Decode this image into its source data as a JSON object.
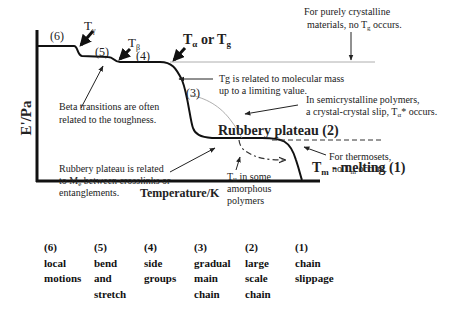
{
  "axes": {
    "y_label": "E'/Pa",
    "x_label": "Temperature/K"
  },
  "regions": [
    {
      "id": "6",
      "label": "(6)"
    },
    {
      "id": "5",
      "label": "(5)"
    },
    {
      "id": "4",
      "label": "(4)"
    },
    {
      "id": "3",
      "label": "(3)"
    }
  ],
  "transitions": {
    "gamma": {
      "base": "T",
      "sub": "γ"
    },
    "beta": {
      "base": "T",
      "sub": "β"
    },
    "alpha_g": {
      "base": "T",
      "sub1": "α",
      "mid": " or ",
      "base2": "T",
      "sub2": "g"
    },
    "melting": {
      "base": "T",
      "sub": "m",
      "rest": " - melting (1)"
    },
    "rubbery": "Rubbery plateau (2)"
  },
  "notes": {
    "crystalline": {
      "line1": "For purely crystalline",
      "line2_a": "materials,  no T",
      "line2_sub": "g",
      "line2_b": " occurs."
    },
    "tg_mass": {
      "line1": "Tg is related to molecular mass",
      "line2": "up to a limiting value."
    },
    "beta": {
      "line1": "Beta transitions are often",
      "line2": "related to the toughness."
    },
    "semicrystalline": {
      "line1": "In semicrystalline polymers,",
      "line2_a": "a crystal-crystal slip, T",
      "line2_sub": "α",
      "line2_b": "* occurs."
    },
    "rubbery": {
      "line1": "Rubbery plateau is related",
      "line2_a": "to M",
      "line2_sub": "e",
      "line2_b": " between crosslinks or",
      "line3": "entanglements."
    },
    "thermosets": {
      "line1": "For thermosets,",
      "line2_a": "no T",
      "line2_sub": "m",
      "line2_b": " occurs."
    },
    "tll": {
      "line1_a": "T",
      "line1_sub": "ll",
      "line1_b": "  in some",
      "line2": "amorphous",
      "line3": "polymers"
    }
  },
  "legend": [
    {
      "num": "(6)",
      "lines": [
        "local",
        "motions"
      ]
    },
    {
      "num": "(5)",
      "lines": [
        "bend",
        "and",
        "stretch"
      ]
    },
    {
      "num": "(4)",
      "lines": [
        "side",
        "groups"
      ]
    },
    {
      "num": "(3)",
      "lines": [
        "gradual",
        "main",
        "chain"
      ]
    },
    {
      "num": "(2)",
      "lines": [
        "large",
        "scale",
        "chain"
      ]
    },
    {
      "num": "(1)",
      "lines": [
        "chain",
        "slippage"
      ]
    }
  ]
}
